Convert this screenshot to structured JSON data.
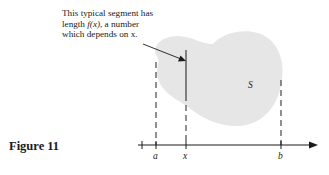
{
  "figure": {
    "caption": "Figure 11",
    "annotation": {
      "line1": "This typical segment has",
      "line2_prefix": "length ",
      "line2_func": "f(x)",
      "line2_suffix": ", a number",
      "line3": "which depends on x."
    },
    "region_label": "S",
    "axis_labels": {
      "a": "a",
      "x": "x",
      "b": "b"
    },
    "colors": {
      "region_fill": "#e6e6e6",
      "ink": "#1a1a1a",
      "dash": "#555555"
    }
  }
}
